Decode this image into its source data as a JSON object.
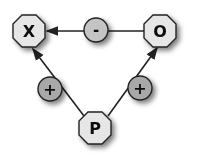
{
  "diagram": {
    "nodes": [
      {
        "id": "X",
        "label": "X",
        "shape": "octagon",
        "cx": 29,
        "cy": 31
      },
      {
        "id": "O",
        "label": "O",
        "shape": "octagon",
        "cx": 160,
        "cy": 31
      },
      {
        "id": "P",
        "label": "P",
        "shape": "octagon",
        "cx": 95,
        "cy": 128
      }
    ],
    "signs": [
      {
        "id": "minus",
        "label": "-",
        "cx": 96,
        "cy": 30
      },
      {
        "id": "plus_left",
        "label": "+",
        "cx": 50,
        "cy": 89
      },
      {
        "id": "plus_right",
        "label": "+",
        "cx": 140,
        "cy": 88
      }
    ],
    "edges": [
      {
        "from": "O",
        "to": "X",
        "sign": "-"
      },
      {
        "from": "P",
        "to": "X",
        "sign": "+"
      },
      {
        "from": "P",
        "to": "O",
        "sign": "+"
      }
    ],
    "colors": {
      "node_fill": "#e6e6e6",
      "sign_fill": "#a8a8a8",
      "stroke": "#222222"
    }
  }
}
